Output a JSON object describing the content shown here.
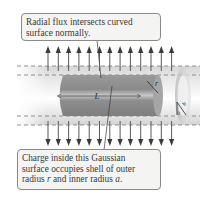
{
  "figure": {
    "type": "gaussian-surface-cylindrical-shell",
    "top_callout": {
      "lines": [
        "Radial flux intersects curved",
        "surface normally."
      ]
    },
    "bottom_callout": {
      "line1": "Charge inside this Gaussian",
      "line2": "surface occupies shell of outer",
      "line3_pre": "radius ",
      "line3_r": "r",
      "line3_mid": " and inner radius ",
      "line3_a": "a",
      "line3_post": "."
    },
    "labels": {
      "length": "L",
      "radius": "r",
      "inner_radius": "a",
      "outer_shell_radius": "b"
    },
    "flux_arrows": {
      "up_count": 13,
      "down_count": 13
    },
    "colors": {
      "arrow": "#5a5a5a",
      "cylinder": "#8f8f8f",
      "cylinder_highlight": "#c4c4c4",
      "shell": "#e2e2e2",
      "dashed": "#7a7a7a",
      "callout_bg": "#f4f4f2",
      "callout_border": "#8a8a8a"
    }
  }
}
